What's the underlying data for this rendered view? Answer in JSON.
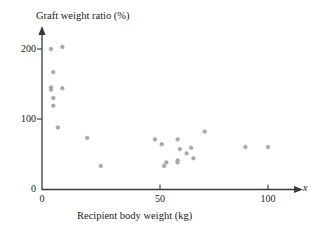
{
  "chart_data": {
    "type": "scatter",
    "title": "Graft weight ratio (%)",
    "xlabel": "Recipient body weight (kg)",
    "ylabel": "Graft weight ratio (%)",
    "x_variable_symbol": "x",
    "xlim": [
      0,
      110
    ],
    "ylim": [
      0,
      230
    ],
    "xticks": [
      0,
      50,
      100
    ],
    "yticks": [
      0,
      100,
      200
    ],
    "xtick_labels": [
      "0",
      "50",
      "100"
    ],
    "ytick_labels": [
      "0",
      "100",
      "200"
    ],
    "grid": false,
    "legend": false,
    "marker": "filled-circle",
    "marker_color": "#a9a9a9",
    "axis_color": "#3a3a3a",
    "points": [
      {
        "x": 4,
        "y": 200
      },
      {
        "x": 9,
        "y": 203
      },
      {
        "x": 5,
        "y": 167
      },
      {
        "x": 4,
        "y": 145
      },
      {
        "x": 4,
        "y": 142
      },
      {
        "x": 9,
        "y": 144
      },
      {
        "x": 5,
        "y": 130
      },
      {
        "x": 5,
        "y": 119
      },
      {
        "x": 7,
        "y": 88
      },
      {
        "x": 20,
        "y": 73
      },
      {
        "x": 26,
        "y": 33
      },
      {
        "x": 50,
        "y": 71
      },
      {
        "x": 53,
        "y": 64
      },
      {
        "x": 60,
        "y": 71
      },
      {
        "x": 61,
        "y": 57
      },
      {
        "x": 66,
        "y": 59
      },
      {
        "x": 64,
        "y": 51
      },
      {
        "x": 67,
        "y": 44
      },
      {
        "x": 60,
        "y": 41
      },
      {
        "x": 60,
        "y": 38
      },
      {
        "x": 55,
        "y": 38
      },
      {
        "x": 54,
        "y": 33
      },
      {
        "x": 72,
        "y": 82
      },
      {
        "x": 90,
        "y": 60
      },
      {
        "x": 100,
        "y": 60
      }
    ]
  },
  "axes": {
    "y_axis_name": "graft-weight-ratio-axis",
    "x_axis_name": "recipient-body-weight-axis"
  }
}
